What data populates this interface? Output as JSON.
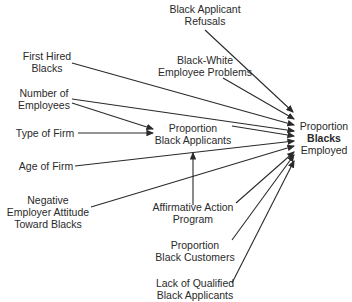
{
  "diagram": {
    "type": "path-diagram",
    "target": {
      "lines": [
        "Proportion",
        "Blacks",
        "Employed"
      ]
    },
    "mediator": {
      "lines": [
        "Proportion",
        "Black Applicants"
      ]
    },
    "nodes": [
      {
        "id": "refusals",
        "lines": [
          "Black Applicant",
          "Refusals"
        ]
      },
      {
        "id": "bw_problems",
        "lines": [
          "Black-White",
          "Employee Problems"
        ]
      },
      {
        "id": "first_hired",
        "lines": [
          "First Hired",
          "Blacks"
        ]
      },
      {
        "id": "num_employees",
        "lines": [
          "Number of",
          "Employees"
        ]
      },
      {
        "id": "type_firm",
        "lines": [
          "Type of Firm"
        ]
      },
      {
        "id": "age_firm",
        "lines": [
          "Age of Firm"
        ]
      },
      {
        "id": "neg_attitude",
        "lines": [
          "Negative",
          "Employer Attitude",
          "Toward Blacks"
        ]
      },
      {
        "id": "affirmative",
        "lines": [
          "Affirmative Action",
          "Program"
        ]
      },
      {
        "id": "black_customers",
        "lines": [
          "Proportion",
          "Black Customers"
        ]
      },
      {
        "id": "lack_qualified",
        "lines": [
          "Lack of Qualified",
          "Black Applicants"
        ]
      }
    ],
    "edges": [
      [
        "Black Applicant Refusals",
        "Proportion Blacks Employed"
      ],
      [
        "Black-White Employee Problems",
        "Proportion Blacks Employed"
      ],
      [
        "First Hired Blacks",
        "Proportion Blacks Employed"
      ],
      [
        "Number of Employees",
        "Proportion Blacks Employed"
      ],
      [
        "Number of Employees",
        "Proportion Black Applicants"
      ],
      [
        "Type of Firm",
        "Proportion Black Applicants"
      ],
      [
        "Proportion Black Applicants",
        "Proportion Blacks Employed"
      ],
      [
        "Age of Firm",
        "Proportion Blacks Employed"
      ],
      [
        "Negative Employer Attitude Toward Blacks",
        "Proportion Blacks Employed"
      ],
      [
        "Affirmative Action Program",
        "Proportion Black Applicants"
      ],
      [
        "Affirmative Action Program",
        "Proportion Blacks Employed"
      ],
      [
        "Proportion Black Customers",
        "Proportion Blacks Employed"
      ],
      [
        "Lack of Qualified Black Applicants",
        "Proportion Blacks Employed"
      ]
    ]
  }
}
